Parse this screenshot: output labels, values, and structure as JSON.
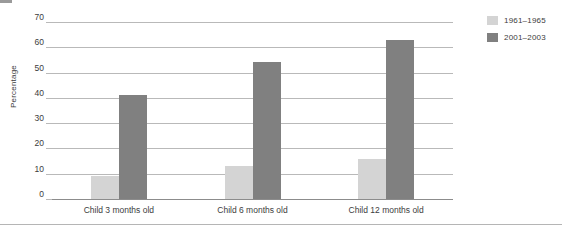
{
  "chart_data": {
    "type": "bar",
    "title": "",
    "subtitle": "",
    "xlabel": "",
    "ylabel": "Percentage",
    "ylim": [
      0,
      70
    ],
    "yticks": [
      0,
      10,
      20,
      30,
      40,
      50,
      60,
      70
    ],
    "ytick_labels": [
      "0",
      "10",
      "20",
      "30",
      "40",
      "50",
      "60",
      "70"
    ],
    "grid": true,
    "legend_position": "right-top",
    "categories": [
      "Child 3 months old",
      "Child 6 months old",
      "Child 12 months old"
    ],
    "series": [
      {
        "name": "1961–1965",
        "color": "#d4d4d4",
        "values": [
          9,
          13,
          16
        ]
      },
      {
        "name": "2001–2003",
        "color": "#808080",
        "values": [
          41,
          54,
          63
        ]
      }
    ]
  },
  "legend": {
    "items": [
      {
        "label": "1961–1965"
      },
      {
        "label": "2001–2003"
      }
    ]
  }
}
